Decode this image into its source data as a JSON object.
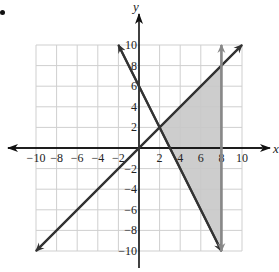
{
  "chart_data": {
    "type": "line",
    "title": "",
    "xlabel": "x",
    "ylabel": "y",
    "xlim": [
      -10,
      10
    ],
    "ylim": [
      -10,
      10
    ],
    "grid": true,
    "grid_step": 2,
    "x_ticks": [
      "−10",
      "−8",
      "−6",
      "−4",
      "−2",
      "2",
      "4",
      "6",
      "8",
      "10"
    ],
    "y_ticks": [
      "10",
      "8",
      "6",
      "4",
      "2",
      "−2",
      "−4",
      "−6",
      "−8",
      "−10"
    ],
    "series": [
      {
        "name": "y = x",
        "x": [
          -10,
          10
        ],
        "y": [
          -10,
          10
        ],
        "color": "#333333"
      },
      {
        "name": "y = -2x + 6",
        "x": [
          -2,
          8
        ],
        "y": [
          10,
          -10
        ],
        "color": "#333333"
      },
      {
        "name": "x = 8",
        "x": [
          8,
          8
        ],
        "y": [
          -10,
          10
        ],
        "color": "#888888"
      }
    ],
    "shaded_region": {
      "description": "region bounded by y = x, y = -2x + 6 and x = 8",
      "vertices": [
        [
          2,
          2
        ],
        [
          8,
          8
        ],
        [
          8,
          -10
        ]
      ],
      "color": "#c8c8c8"
    },
    "legend": null
  },
  "labels": {
    "x_axis": "x",
    "y_axis": "y"
  }
}
